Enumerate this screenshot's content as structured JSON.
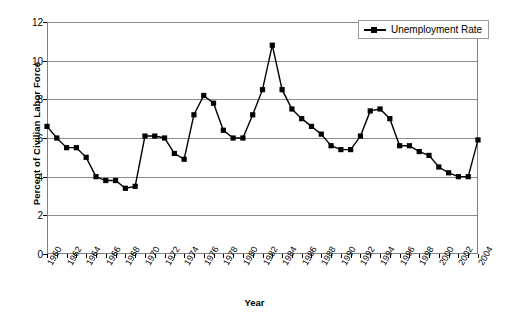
{
  "chart_data": {
    "type": "line",
    "title": "",
    "xlabel": "Year",
    "ylabel": "Percent of Civilian Labor Force",
    "ylim": [
      0,
      12
    ],
    "ytick_step": 2,
    "yticks": [
      0,
      2,
      4,
      6,
      8,
      10,
      12
    ],
    "xlim": [
      1960,
      2004
    ],
    "grid": true,
    "legend_position": "top-right",
    "series": [
      {
        "name": "Unemployment Rate",
        "color": "#000000",
        "marker": "square",
        "x": [
          1960,
          1961,
          1962,
          1963,
          1964,
          1965,
          1966,
          1967,
          1968,
          1969,
          1970,
          1971,
          1972,
          1973,
          1974,
          1975,
          1976,
          1977,
          1978,
          1979,
          1980,
          1981,
          1982,
          1983,
          1984,
          1985,
          1986,
          1987,
          1988,
          1989,
          1990,
          1991,
          1992,
          1993,
          1994,
          1995,
          1996,
          1997,
          1998,
          1999,
          2000,
          2001,
          2002,
          2003,
          2004
        ],
        "values": [
          6.6,
          6.0,
          5.5,
          5.5,
          5.0,
          4.0,
          3.8,
          3.8,
          3.4,
          3.5,
          6.1,
          6.1,
          6.0,
          5.2,
          4.9,
          7.2,
          8.2,
          7.8,
          6.4,
          6.0,
          6.0,
          7.2,
          8.5,
          10.8,
          8.5,
          7.5,
          7.0,
          6.6,
          6.2,
          5.6,
          5.4,
          5.4,
          6.1,
          7.4,
          7.5,
          7.0,
          5.6,
          5.6,
          5.3,
          5.1,
          4.5,
          4.2,
          4.0,
          4.0,
          5.9
        ]
      }
    ],
    "xtick_labels": [
      "1960",
      "1962",
      "1964",
      "1966",
      "1968",
      "1970",
      "1972",
      "1974",
      "1976",
      "1978",
      "1980",
      "1982",
      "1984",
      "1986",
      "1988",
      "1990",
      "1992",
      "1994",
      "1996",
      "1998",
      "2000",
      "2002",
      "2004"
    ],
    "xtick_label_values": [
      1960,
      1962,
      1964,
      1966,
      1968,
      1970,
      1972,
      1974,
      1976,
      1978,
      1980,
      1982,
      1984,
      1986,
      1988,
      1990,
      1992,
      1994,
      1996,
      1998,
      2000,
      2002,
      2004
    ]
  },
  "legend": {
    "label": "Unemployment Rate"
  },
  "axes": {
    "x_title": "Year",
    "y_title": "Percent of Civilian Labor Force"
  }
}
